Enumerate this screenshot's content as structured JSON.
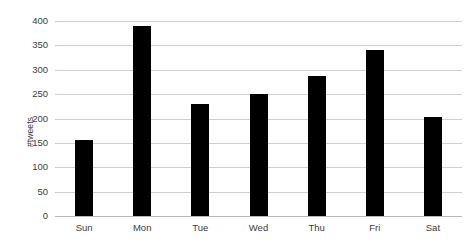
{
  "chart_data": {
    "type": "bar",
    "title": "",
    "xlabel": "",
    "ylabel": "#tweets",
    "categories": [
      "Sun",
      "Mon",
      "Tue",
      "Wed",
      "Thu",
      "Fri",
      "Sat"
    ],
    "values": [
      156,
      390,
      230,
      250,
      288,
      340,
      203
    ],
    "yticks": [
      0,
      50,
      100,
      150,
      200,
      250,
      300,
      350,
      400
    ],
    "ylim": [
      0,
      400
    ],
    "grid": true,
    "legend": null,
    "bar_color": "#000000",
    "grid_color": "#cfcfcf",
    "background": "#ffffff"
  },
  "caption": {
    "text": ""
  }
}
